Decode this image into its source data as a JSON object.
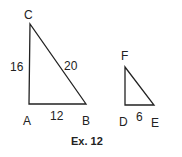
{
  "diagram": {
    "caption": "Ex. 12",
    "stroke_color": "#222222",
    "triangles": [
      {
        "name": "ABC",
        "vertices": {
          "A": {
            "label": "A",
            "x": 29,
            "y": 104
          },
          "B": {
            "label": "B",
            "x": 86,
            "y": 104
          },
          "C": {
            "label": "C",
            "x": 30,
            "y": 24
          }
        },
        "sides": {
          "AC": "16",
          "CB": "20",
          "AB": "12"
        }
      },
      {
        "name": "DEF",
        "vertices": {
          "D": {
            "label": "D",
            "x": 125,
            "y": 105
          },
          "E": {
            "label": "E",
            "x": 154,
            "y": 105
          },
          "F": {
            "label": "F",
            "x": 125,
            "y": 67
          }
        },
        "sides": {
          "DE": "6"
        }
      }
    ]
  }
}
